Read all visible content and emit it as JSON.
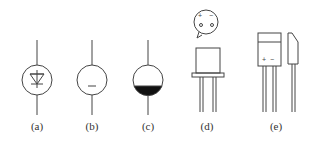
{
  "figure": {
    "panels": [
      {
        "id": "a",
        "label": "(a)",
        "symbol": "photodiode-symbol"
      },
      {
        "id": "b",
        "label": "(b)",
        "symbol": "cell-symbol-minus",
        "mark": "−"
      },
      {
        "id": "c",
        "label": "(c)",
        "symbol": "cell-symbol-filled-half"
      },
      {
        "id": "d",
        "label": "(d)",
        "symbol": "round-can-package",
        "top_marks": [
          "+",
          "−"
        ]
      },
      {
        "id": "e",
        "label": "(e)",
        "symbol": "flat-package",
        "marks": [
          "+",
          "−"
        ]
      }
    ],
    "colors": {
      "line": "#444444",
      "fill": "#111111",
      "background": "#ffffff"
    }
  }
}
